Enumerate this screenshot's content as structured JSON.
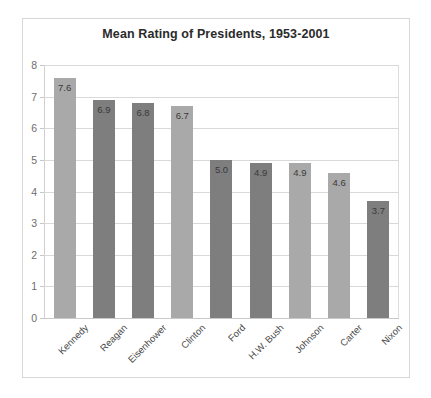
{
  "chart_data": {
    "type": "bar",
    "title": "Mean Rating of Presidents, 1953-2001",
    "xlabel": "",
    "ylabel": "",
    "ylim": [
      0,
      8
    ],
    "yticks": [
      0,
      1,
      2,
      3,
      4,
      5,
      6,
      7,
      8
    ],
    "grid": true,
    "legend": false,
    "categories": [
      "Kennedy",
      "Reagan",
      "Eisenhower",
      "Clinton",
      "Ford",
      "H.W. Bush",
      "Johnson",
      "Carter",
      "Nixon"
    ],
    "values": [
      7.6,
      6.9,
      6.8,
      6.7,
      5.0,
      4.9,
      4.9,
      4.6,
      3.7
    ],
    "value_labels": [
      "7.6",
      "6.9",
      "6.8",
      "6.7",
      "5.0",
      "4.9",
      "4.9",
      "4.6",
      "3.7"
    ],
    "bar_shades": [
      "light",
      "dark",
      "dark",
      "light",
      "dark",
      "dark",
      "light",
      "light",
      "dark"
    ],
    "colors": {
      "bar_light": "#a9a9a9",
      "bar_dark": "#7e7e7e",
      "gridline": "#d9d9d9",
      "title_text": "#2b2b2b",
      "axis_text": "#6d6d6d",
      "category_text": "#4a4a4a",
      "value_text": "#3a3a3a",
      "frame_border": "#d8d8d8",
      "background": "#ffffff"
    }
  }
}
